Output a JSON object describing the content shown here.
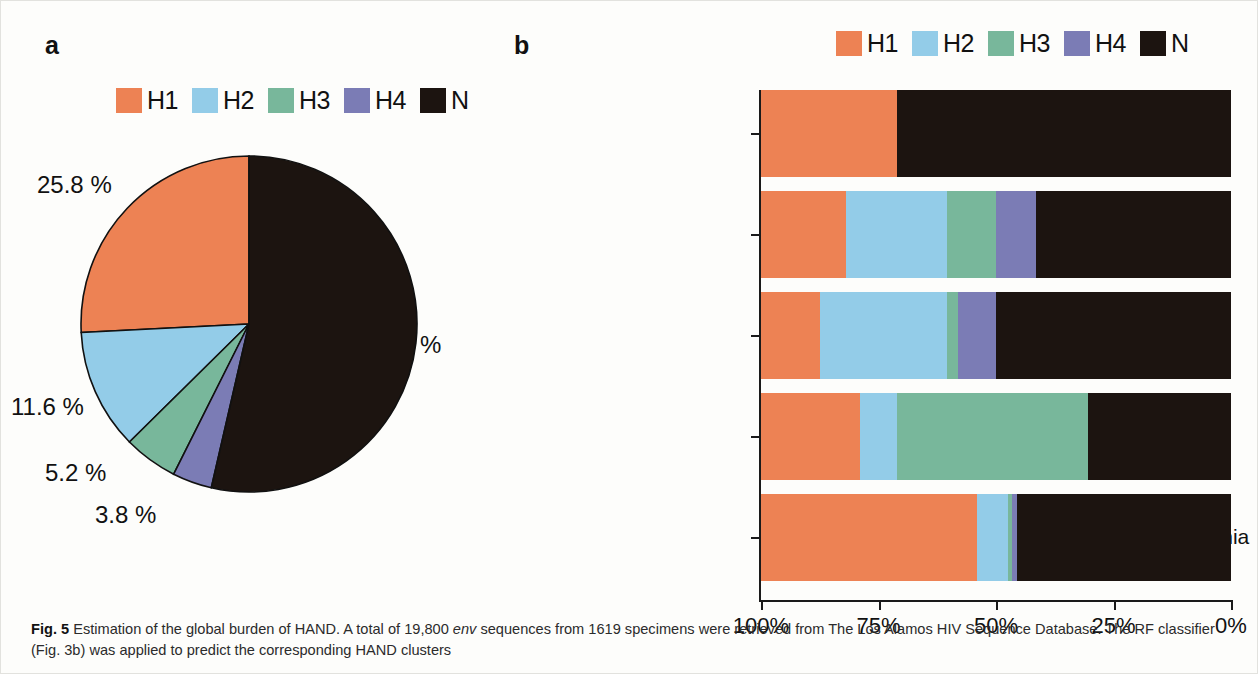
{
  "panels": {
    "a": {
      "letter": "a"
    },
    "b": {
      "letter": "b"
    }
  },
  "legend": {
    "items": [
      {
        "label": "H1",
        "color": "#ED8254"
      },
      {
        "label": "H2",
        "color": "#93CCE8"
      },
      {
        "label": "H3",
        "color": "#78B79B"
      },
      {
        "label": "H4",
        "color": "#7B7CB5"
      },
      {
        "label": "N",
        "color": "#1C1410"
      }
    ]
  },
  "caption": {
    "figure_number": "Fig. 5",
    "text_1": " Estimation of the global burden of HAND. A total of 19,800 ",
    "italic_1": "env",
    "text_2": " sequences from 1619 specimens were retrieved from The Los Alamos HIV Sequence Database. The RF classifier (Fig. 3b) was applied to predict the corresponding HAND clusters"
  },
  "chart_data": [
    {
      "type": "pie",
      "panel": "a",
      "title": "",
      "legend_position": "top",
      "categories": [
        "H1",
        "H2",
        "H3",
        "H4",
        "N"
      ],
      "values": [
        25.8,
        11.6,
        5.2,
        3.8,
        53.6
      ],
      "labels": [
        "25.8 %",
        "11.6 %",
        "5.2 %",
        "3.8 %",
        "%"
      ],
      "colors": [
        "#ED8254",
        "#93CCE8",
        "#78B79B",
        "#7B7CB5",
        "#1C1410"
      ],
      "start_angle_deg": 0,
      "direction": "counterclockwise",
      "note": "N slice label value is cut off in the figure; only the percent sign is visible"
    },
    {
      "type": "bar",
      "panel": "b",
      "orientation": "horizontal",
      "stacked": true,
      "title": "",
      "xlabel": "",
      "ylabel": "",
      "xlim": [
        100,
        0
      ],
      "x_reversed": true,
      "xticks": [
        100,
        75,
        50,
        25,
        0
      ],
      "xticklabels": [
        "100%",
        "75%",
        "50%",
        "25%",
        "0%"
      ],
      "grid": false,
      "legend_position": "top-right",
      "categories": [
        "Sub–Saharan Africa",
        "North America",
        "Europe",
        "Caribbean",
        "Asia/Middle–East/Oceania"
      ],
      "series": [
        {
          "name": "H1",
          "color": "#ED8254",
          "values": [
            29.0,
            18.0,
            12.5,
            21.0,
            46.0
          ]
        },
        {
          "name": "H2",
          "color": "#93CCE8",
          "values": [
            0.0,
            21.5,
            27.0,
            8.0,
            6.5
          ]
        },
        {
          "name": "H3",
          "color": "#78B79B",
          "values": [
            0.0,
            10.5,
            2.5,
            40.5,
            1.0
          ]
        },
        {
          "name": "H4",
          "color": "#7B7CB5",
          "values": [
            0.0,
            8.5,
            8.0,
            0.0,
            1.0
          ]
        },
        {
          "name": "N",
          "color": "#1C1410",
          "values": [
            71.0,
            41.5,
            50.0,
            30.5,
            45.5
          ]
        }
      ]
    }
  ]
}
